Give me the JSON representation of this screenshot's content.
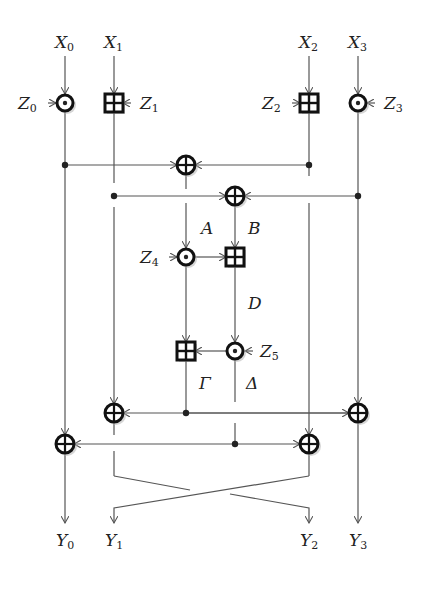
{
  "diagram": {
    "title": "",
    "inputs": [
      {
        "name": "X",
        "sub": "0",
        "x": 65
      },
      {
        "name": "X",
        "sub": "1",
        "x": 114
      },
      {
        "name": "X",
        "sub": "2",
        "x": 309
      },
      {
        "name": "X",
        "sub": "3",
        "x": 358
      }
    ],
    "outputs": [
      {
        "name": "Y",
        "sub": "0",
        "x": 65
      },
      {
        "name": "Y",
        "sub": "1",
        "x": 114
      },
      {
        "name": "Y",
        "sub": "2",
        "x": 309
      },
      {
        "name": "Y",
        "sub": "3",
        "x": 358
      }
    ],
    "keys": [
      {
        "name": "Z",
        "sub": "0",
        "op": "multiply",
        "side": "left"
      },
      {
        "name": "Z",
        "sub": "1",
        "op": "add",
        "side": "right"
      },
      {
        "name": "Z",
        "sub": "2",
        "op": "add",
        "side": "left"
      },
      {
        "name": "Z",
        "sub": "3",
        "op": "multiply",
        "side": "right"
      },
      {
        "name": "Z",
        "sub": "4",
        "op": "multiply",
        "side": "left"
      },
      {
        "name": "Z",
        "sub": "5",
        "op": "multiply",
        "side": "right"
      }
    ],
    "intermediate_labels": {
      "A": "A",
      "B": "B",
      "D": "D",
      "Gamma": "Γ",
      "Delta": "Δ"
    },
    "operators": {
      "multiply": "⊙ (modular multiplication)",
      "add": "⊞ (modular addition)",
      "xor": "⊕ (XOR)"
    }
  }
}
